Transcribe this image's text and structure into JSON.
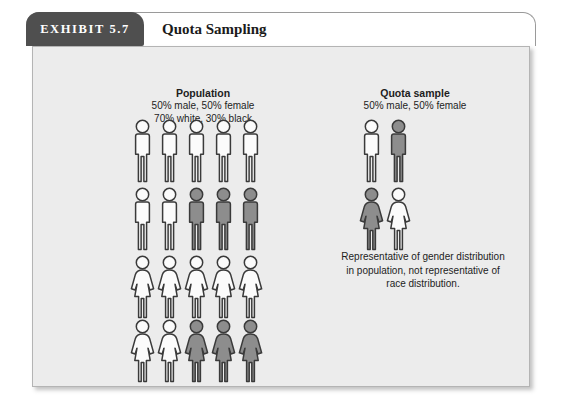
{
  "exhibit": {
    "tab_label": "EXHIBIT 5.7",
    "title": "Quota Sampling"
  },
  "population": {
    "heading": "Population",
    "sub1": "50% male, 50% female",
    "sub2": "70% white, 30% black"
  },
  "quota": {
    "heading": "Quota sample",
    "sub1": "50% male, 50% female"
  },
  "note": {
    "line1": "Representative of gender distribution",
    "line2": "in population, not representative of",
    "line3": "race distribution."
  },
  "colors": {
    "panel_bg": "#ececec",
    "tab_bg": "#4f4f4f",
    "figure_white": "#fbfbfb",
    "figure_gray": "#8d8d8d",
    "figure_outline": "#3a3a3a",
    "text": "#1d1d1d"
  },
  "chart_data": {
    "type": "pictogram",
    "title": "Quota Sampling",
    "groups": [
      {
        "name": "Population",
        "labels": [
          "50% male, 50% female",
          "70% white, 30% black"
        ],
        "total_figures": 20,
        "rows": [
          {
            "gender": "male",
            "figures": [
              "white",
              "white",
              "white",
              "white",
              "white"
            ]
          },
          {
            "gender": "male",
            "figures": [
              "white",
              "white",
              "gray",
              "gray",
              "gray"
            ]
          },
          {
            "gender": "female",
            "figures": [
              "white",
              "white",
              "white",
              "white",
              "white"
            ]
          },
          {
            "gender": "female",
            "figures": [
              "white",
              "white",
              "gray",
              "gray",
              "gray"
            ]
          }
        ],
        "counts": {
          "male": 10,
          "female": 10,
          "white": 14,
          "gray": 6
        },
        "percentages": {
          "male": 50,
          "female": 50,
          "white": 70,
          "black": 30
        }
      },
      {
        "name": "Quota sample",
        "labels": [
          "50% male, 50% female"
        ],
        "total_figures": 4,
        "rows": [
          {
            "gender": "male",
            "figures": [
              "white",
              "gray"
            ]
          },
          {
            "gender": "female",
            "figures": [
              "gray",
              "white"
            ]
          }
        ],
        "counts": {
          "male": 2,
          "female": 2,
          "white": 2,
          "gray": 2
        },
        "percentages": {
          "male": 50,
          "female": 50,
          "white": 50,
          "black": 50
        }
      }
    ],
    "annotation": "Representative of gender distribution in population, not representative of race distribution."
  }
}
